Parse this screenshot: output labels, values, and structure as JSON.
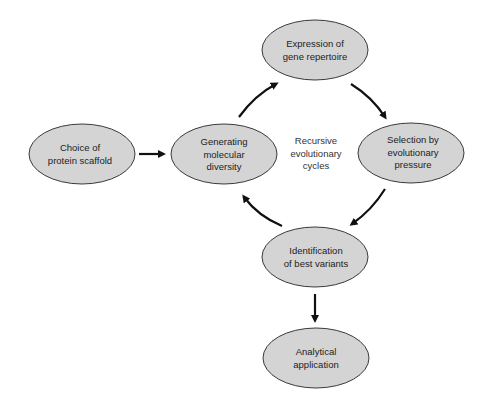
{
  "diagram": {
    "type": "cycle-flowchart",
    "nodes": [
      {
        "id": "choice",
        "lines": [
          "Choice of",
          "protein scaffold"
        ]
      },
      {
        "id": "generating",
        "lines": [
          "Generating",
          "molecular",
          "diversity"
        ]
      },
      {
        "id": "expression",
        "lines": [
          "Expression of",
          "gene repertoire"
        ]
      },
      {
        "id": "selection",
        "lines": [
          "Selection by",
          "evolutionary",
          "pressure"
        ]
      },
      {
        "id": "identification",
        "lines": [
          "Identification",
          "of best variants"
        ]
      },
      {
        "id": "analytical",
        "lines": [
          "Analytical",
          "application"
        ]
      }
    ],
    "center_label": [
      "Recursive",
      "evolutionary",
      "cycles"
    ],
    "edges": [
      {
        "from": "choice",
        "to": "generating"
      },
      {
        "from": "generating",
        "to": "expression"
      },
      {
        "from": "expression",
        "to": "selection"
      },
      {
        "from": "selection",
        "to": "identification"
      },
      {
        "from": "identification",
        "to": "generating"
      },
      {
        "from": "identification",
        "to": "analytical"
      }
    ],
    "colors": {
      "node_fill": "#d4d4d4",
      "node_stroke": "#3a3a3a",
      "arrow": "#111111"
    }
  }
}
